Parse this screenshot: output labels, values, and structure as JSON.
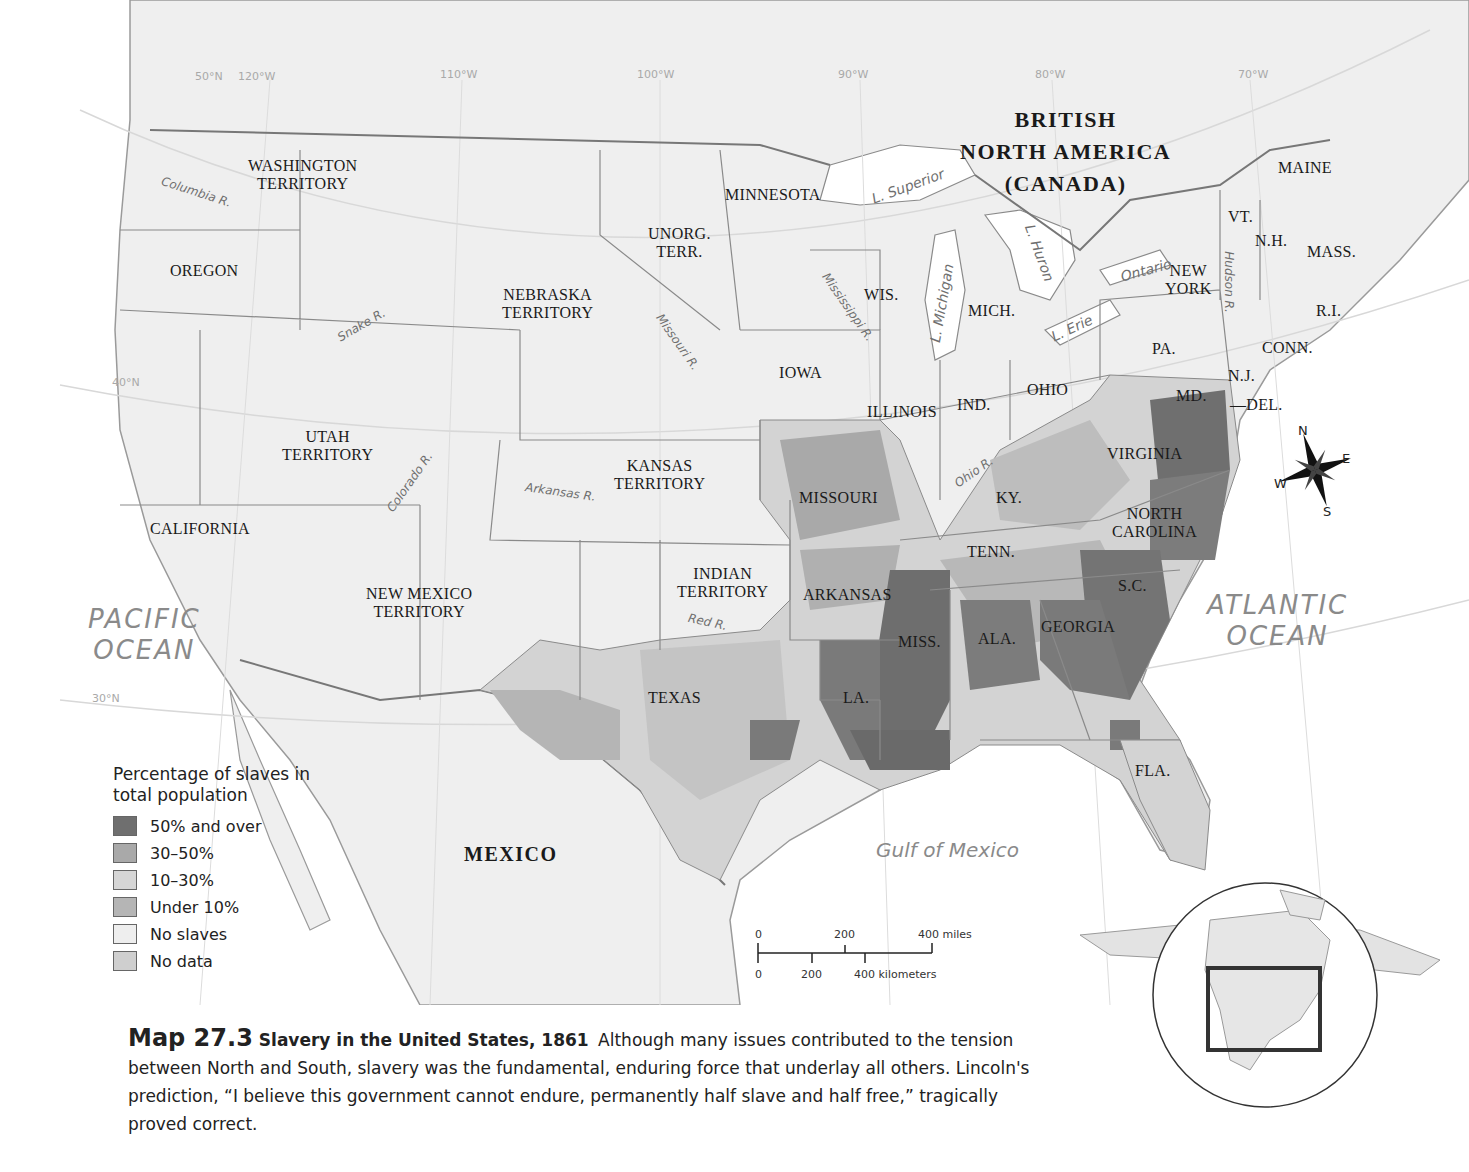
{
  "map": {
    "title_number": "Map 27.3",
    "title": "Slavery in the United States, 1861",
    "caption_text": "Although many issues contributed to the tension between North and South, slavery was the fundamental, enduring force that underlay all others. Lincoln's prediction, “I believe this government cannot endure, permanently half slave and half free,” tragically proved correct.",
    "regions": {
      "british_na": [
        "BRITISH",
        "NORTH AMERICA",
        "(CANADA)"
      ],
      "mexico": "MEXICO",
      "states": {
        "washington": [
          "WASHINGTON",
          "TERRITORY"
        ],
        "oregon": "OREGON",
        "california": "CALIFORNIA",
        "utah": [
          "UTAH",
          "TERRITORY"
        ],
        "new_mexico": [
          "NEW MEXICO",
          "TERRITORY"
        ],
        "nebraska": [
          "NEBRASKA",
          "TERRITORY"
        ],
        "kansas": [
          "KANSAS",
          "TERRITORY"
        ],
        "unorg": [
          "UNORG.",
          "TERR."
        ],
        "minnesota": "MINNESOTA",
        "iowa": "IOWA",
        "missouri": "MISSOURI",
        "indian": [
          "INDIAN",
          "TERRITORY"
        ],
        "arkansas": "ARKANSAS",
        "texas": "TEXAS",
        "la": "LA.",
        "miss": "MISS.",
        "ala": "ALA.",
        "georgia": "GEORGIA",
        "fla": "FLA.",
        "sc": "S.C.",
        "nc": [
          "NORTH",
          "CAROLINA"
        ],
        "tenn": "TENN.",
        "ky": "KY.",
        "virginia": "VIRGINIA",
        "md": "MD.",
        "del": "—DEL.",
        "nj": "N.J.",
        "pa": "PA.",
        "ohio": "OHIO",
        "ind": "IND.",
        "illinois": "ILLINOIS",
        "wis": "WIS.",
        "mich": "MICH.",
        "ny": [
          "NEW",
          "YORK"
        ],
        "vt": "VT.",
        "nh": "N.H.",
        "mass": "MASS.",
        "ri": "R.I.",
        "conn": "CONN.",
        "maine": "MAINE"
      }
    },
    "water": {
      "pacific": [
        "PACIFIC",
        "OCEAN"
      ],
      "atlantic": [
        "ATLANTIC",
        "OCEAN"
      ],
      "gulf": "Gulf of Mexico",
      "superior": "L. Superior",
      "michigan": "L. Michigan",
      "huron": "L. Huron",
      "erie": "L. Erie",
      "ontario": "Ontario"
    },
    "rivers": {
      "columbia": "Columbia R.",
      "snake": "Snake R.",
      "colorado": "Colorado R.",
      "arkansas": "Arkansas R.",
      "red": "Red R.",
      "missouri": "Missouri R.",
      "mississippi": "Mississippi R.",
      "ohio": "Ohio R.",
      "hudson": "Hudson R."
    },
    "graticule": {
      "lon": [
        "50°N",
        "120°W",
        "110°W",
        "100°W",
        "90°W",
        "80°W",
        "70°W"
      ],
      "lat": [
        "40°N",
        "30°N"
      ]
    },
    "compass": {
      "n": "N",
      "e": "E",
      "s": "S",
      "w": "W"
    },
    "scale": {
      "miles": [
        "0",
        "200",
        "400 miles"
      ],
      "km": [
        "0",
        "200",
        "400 kilometers"
      ]
    },
    "legend": {
      "title": "Percentage of slaves in total population",
      "items": [
        {
          "label": "50% and over",
          "color": "#6f6f6f"
        },
        {
          "label": "30–50%",
          "color": "#a9a9a9"
        },
        {
          "label": "10–30%",
          "color": "#d6d6d6"
        },
        {
          "label": "Under 10%",
          "color": "#b5b5b5"
        },
        {
          "label": "No slaves",
          "color": "#eeeeee"
        },
        {
          "label": "No data",
          "color": "#cfcfcf"
        }
      ]
    }
  }
}
